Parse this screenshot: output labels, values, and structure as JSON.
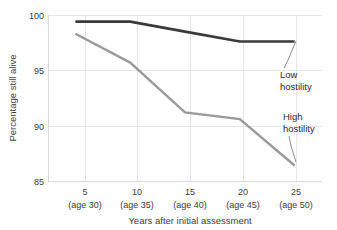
{
  "chart_data": {
    "type": "line",
    "title": "",
    "xlabel": "Years after initial assessment",
    "ylabel": "Percentage still alive",
    "x": [
      5,
      10,
      15,
      20,
      25
    ],
    "categories": [
      "5",
      "10",
      "15",
      "20",
      "25"
    ],
    "tick_sublabels": [
      "(age 30)",
      "(age 35)",
      "(age 40)",
      "(age 45)",
      "(age 50)"
    ],
    "xlim": [
      2.5,
      27.5
    ],
    "ylim": [
      85,
      100
    ],
    "yticks": [
      85,
      90,
      95,
      100
    ],
    "ytick_labels": [
      "85",
      "90",
      "95",
      "100"
    ],
    "grid": true,
    "legend_position": "inline-annotations",
    "series": [
      {
        "name": "Low hostility",
        "color": "#3a3a3a",
        "values": [
          99.4,
          99.4,
          98.5,
          97.6,
          97.6
        ]
      },
      {
        "name": "High hostility",
        "color": "#9a9a9a",
        "values": [
          98.3,
          95.7,
          91.2,
          90.6,
          86.4
        ]
      }
    ],
    "annotations": [
      {
        "text_line1": "Low",
        "text_line2": "hostility",
        "series": "Low hostility"
      },
      {
        "text_line1": "High",
        "text_line2": "hostility",
        "series": "High hostility"
      }
    ]
  },
  "axes": {
    "ylabel": "Percentage still alive",
    "xlabel": "Years after initial assessment",
    "ytick_85": "85",
    "ytick_90": "90",
    "ytick_95": "95",
    "ytick_100": "100",
    "xtick_5": "5",
    "xtick_10": "10",
    "xtick_15": "15",
    "xtick_20": "20",
    "xtick_25": "25",
    "xsub_5": "(age 30)",
    "xsub_10": "(age 35)",
    "xsub_15": "(age 40)",
    "xsub_20": "(age 45)",
    "xsub_25": "(age 50)"
  },
  "annotations": {
    "low_line1": "Low",
    "low_line2": "hostility",
    "high_line1": "High",
    "high_line2": "hostility"
  },
  "colors": {
    "low_hostility": "#3a3a3a",
    "high_hostility": "#9a9a9a",
    "grid": "#e6e6e6",
    "axis": "#d9d9d9",
    "text": "#3d3d3d",
    "background": "#ffffff"
  }
}
